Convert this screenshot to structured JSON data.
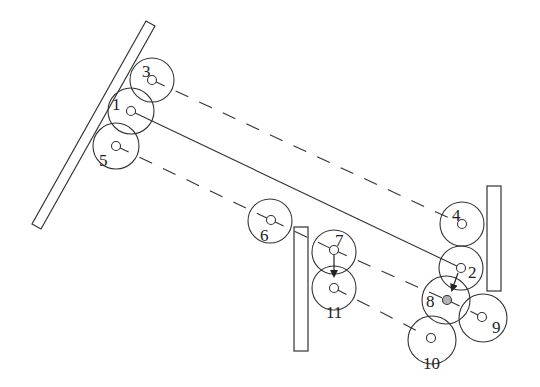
{
  "diagram": {
    "stroke_color": "#333333",
    "highlight_fill": "#b3b3b3",
    "walls": [
      {
        "id": "wall-left",
        "points": [
          [
            32,
            224
          ],
          [
            41,
            229
          ],
          [
            155,
            26
          ],
          [
            146,
            21
          ]
        ]
      },
      {
        "id": "wall-middle",
        "x": 294,
        "y": 227,
        "w": 14,
        "h": 124
      },
      {
        "id": "wall-right",
        "x": 487,
        "y": 186,
        "w": 14,
        "h": 105
      }
    ],
    "nodes": [
      {
        "id": "1",
        "label": "1",
        "cx": 131,
        "cy": 111,
        "r": 23,
        "dot": [
          131,
          111
        ],
        "lx": 112,
        "ly": 110
      },
      {
        "id": "2",
        "label": "2",
        "cx": 461,
        "cy": 268,
        "r": 22,
        "dot": [
          461,
          268
        ],
        "lx": 468,
        "ly": 278
      },
      {
        "id": "3",
        "label": "3",
        "cx": 152,
        "cy": 80,
        "r": 22,
        "dot": [
          152,
          80
        ],
        "lx": 142,
        "ly": 77
      },
      {
        "id": "4",
        "label": "4",
        "cx": 462,
        "cy": 224,
        "r": 22,
        "dot": [
          462,
          224
        ],
        "lx": 452,
        "ly": 221
      },
      {
        "id": "5",
        "label": "5",
        "cx": 116,
        "cy": 146,
        "r": 23,
        "dot": [
          116,
          146
        ],
        "lx": 99,
        "ly": 166
      },
      {
        "id": "6",
        "label": "6",
        "cx": 270,
        "cy": 221,
        "r": 22,
        "dot": [
          271,
          220
        ],
        "lx": 260,
        "ly": 241
      },
      {
        "id": "7",
        "label": "7",
        "cx": 334,
        "cy": 252,
        "r": 22,
        "dot": [
          334,
          250
        ],
        "lx": 335,
        "ly": 246
      },
      {
        "id": "8",
        "label": "8",
        "cx": 446,
        "cy": 300,
        "r": 24,
        "dot": [
          447,
          300
        ],
        "lx": 426,
        "ly": 307,
        "highlight": true
      },
      {
        "id": "9",
        "label": "9",
        "cx": 483,
        "cy": 318,
        "r": 24,
        "dot": [
          482,
          317
        ],
        "lx": 492,
        "ly": 333
      },
      {
        "id": "10",
        "label": "10",
        "cx": 432,
        "cy": 340,
        "r": 24,
        "dot": [
          431,
          338
        ],
        "lx": 423,
        "ly": 369
      },
      {
        "id": "11",
        "label": "11",
        "cx": 334,
        "cy": 288,
        "r": 22,
        "dot": [
          334,
          288
        ],
        "lx": 326,
        "ly": 318
      }
    ],
    "solid_links": [
      {
        "from": "1",
        "to": "2",
        "x1": 131,
        "y1": 111,
        "x2": 461,
        "y2": 268
      }
    ],
    "dashed_links": [
      {
        "from": "3",
        "to": "4",
        "x1": 152,
        "y1": 80,
        "x2": 462,
        "y2": 224
      },
      {
        "from": "5",
        "to": "6",
        "x1": 116,
        "y1": 146,
        "x2": 271,
        "y2": 220
      },
      {
        "from": "6",
        "to": "7",
        "x1": 271,
        "y1": 220,
        "x2": 334,
        "y2": 250
      },
      {
        "from": "7",
        "to": "8",
        "x1": 334,
        "y1": 250,
        "x2": 447,
        "y2": 300
      },
      {
        "from": "8",
        "to": "9",
        "x1": 447,
        "y1": 300,
        "x2": 482,
        "y2": 317
      },
      {
        "from": "11",
        "to": "10",
        "x1": 334,
        "y1": 288,
        "x2": 431,
        "y2": 338
      }
    ],
    "arrows": [
      {
        "from": "7",
        "to": "11",
        "x1": 334,
        "y1": 255,
        "x2": 334,
        "y2": 276
      },
      {
        "from": "2",
        "to": "8",
        "x1": 458,
        "y1": 273,
        "x2": 452,
        "y2": 290
      }
    ]
  }
}
